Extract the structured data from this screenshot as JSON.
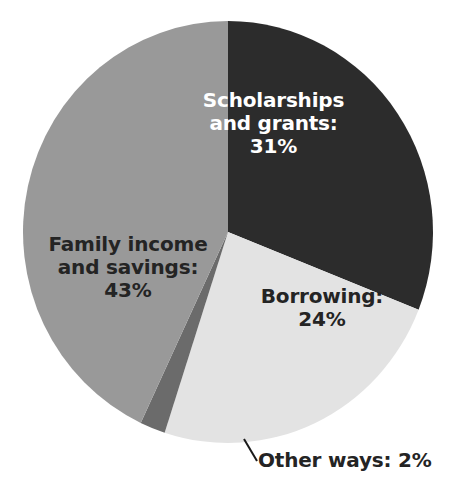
{
  "chart_data": {
    "type": "pie",
    "title": "",
    "subtitle": "",
    "xlabel": "",
    "ylabel": "",
    "legend_position": "none",
    "grid": false,
    "categories": [
      "Scholarships and grants",
      "Borrowing",
      "Other ways",
      "Family income and savings"
    ],
    "values": [
      31,
      24,
      2,
      43
    ],
    "units": "percent",
    "start_angle_deg": 0,
    "direction": "clockwise",
    "slices": [
      {
        "name": "scholarships-and-grants",
        "label_line1": "Scholarships",
        "label_line2": "and grants:",
        "value_label": "31%",
        "value": 31,
        "color": "#2c2c2c",
        "text_color": "#ffffff",
        "start_deg": 0,
        "end_deg": 111.6,
        "leader_line": false
      },
      {
        "name": "borrowing",
        "label_line1": "Borrowing:",
        "label_line2": "",
        "value_label": "24%",
        "value": 24,
        "color": "#e3e3e3",
        "text_color": "#242424",
        "start_deg": 111.6,
        "end_deg": 198.0,
        "leader_line": false
      },
      {
        "name": "other-ways",
        "label_line1": "Other ways: 2%",
        "label_line2": "",
        "value_label": "2%",
        "value": 2,
        "color": "#6b6b6b",
        "text_color": "#242424",
        "start_deg": 198.0,
        "end_deg": 205.2,
        "leader_line": true
      },
      {
        "name": "family-income-and-savings",
        "label_line1": "Family income",
        "label_line2": "and savings:",
        "value_label": "43%",
        "value": 43,
        "color": "#999999",
        "text_color": "#242424",
        "start_deg": 205.2,
        "end_deg": 360.0,
        "leader_line": false
      }
    ],
    "colors": {
      "scholarships": "#2c2c2c",
      "borrowing": "#e3e3e3",
      "other_ways": "#6b6b6b",
      "family_income": "#999999",
      "background": "#ffffff",
      "dark_text": "#242424",
      "light_text": "#ffffff",
      "leader_line": "#1a1a1a"
    },
    "geometry": {
      "center_x": 228,
      "center_y": 232,
      "radius_x": 205,
      "radius_y": 211
    }
  }
}
